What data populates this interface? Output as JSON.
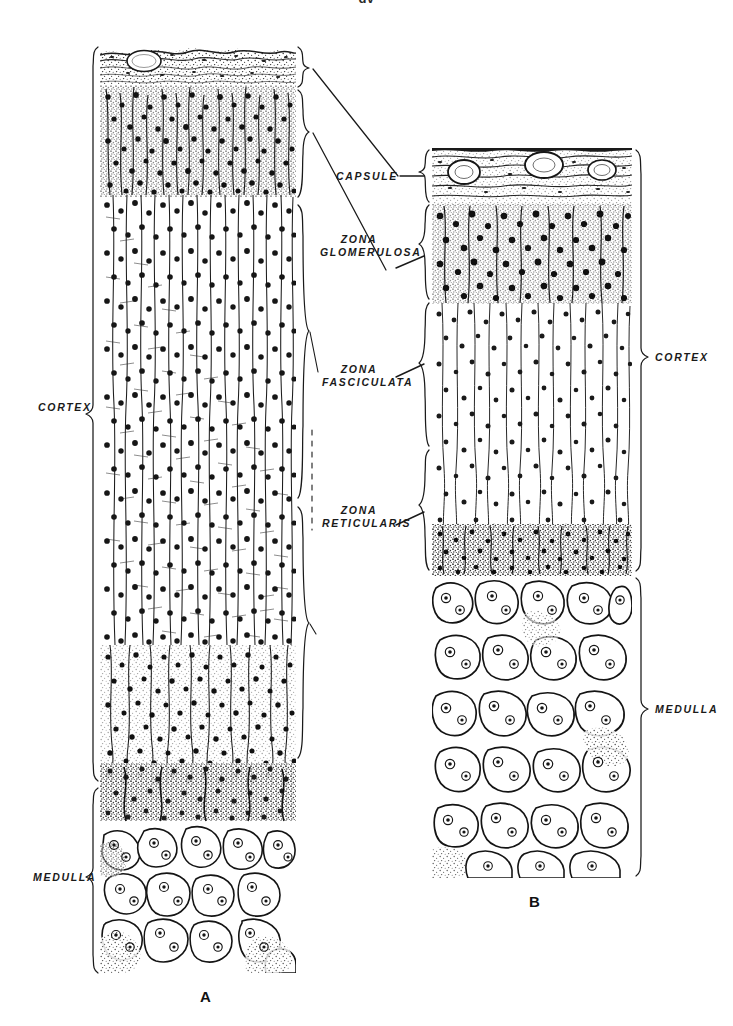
{
  "figure": {
    "cut_caption": "gy",
    "panels": [
      {
        "id": "A",
        "letter": "A",
        "description": "Adrenal cortex and medulla, species A — tall columnar cords",
        "regions": [
          "capsule",
          "zona glomerulosa",
          "zona fasciculata",
          "zona reticularis",
          "medulla"
        ]
      },
      {
        "id": "B",
        "letter": "B",
        "description": "Adrenal cortex and medulla, species B — thick capsule with vessels",
        "regions": [
          "capsule",
          "zona glomerulosa",
          "zona fasciculata",
          "zona reticularis",
          "medulla"
        ]
      }
    ]
  },
  "labels": {
    "left": {
      "cortex": "CORTEX",
      "medulla": "MEDULLA"
    },
    "center": {
      "capsule": "CAPSULE",
      "zona_glomerulosa_line1": "ZONA",
      "zona_glomerulosa_line2": "GLOMERULOSA",
      "zona_fasciculata_line1": "ZONA",
      "zona_fasciculata_line2": "FASCICULATA",
      "zona_reticularis_line1": "ZONA",
      "zona_reticularis_line2": "RETICULARIS"
    },
    "right": {
      "cortex": "CORTEX",
      "medulla": "MEDULLA"
    }
  },
  "colors": {
    "ink": "#1a1a1a",
    "paper": "#ffffff",
    "stipple": "#444444",
    "line": "#222222"
  }
}
